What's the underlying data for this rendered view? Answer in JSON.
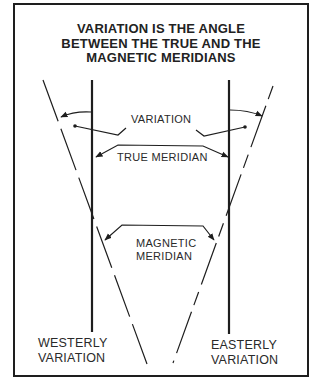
{
  "title": {
    "line1": "VARIATION IS THE ANGLE",
    "line2": "BETWEEN THE TRUE AND THE",
    "line3": "MAGNETIC MERIDIANS"
  },
  "labels": {
    "variation": "VARIATION",
    "true_meridian": "TRUE MERIDIAN",
    "magnetic_meridian_line1": "MAGNETIC",
    "magnetic_meridian_line2": "MERIDIAN",
    "westerly_line1": "WESTERLY",
    "westerly_line2": "VARIATION",
    "easterly_line1": "EASTERLY",
    "easterly_line2": "VARIATION"
  },
  "colors": {
    "ink": "#1e1e1e",
    "background": "#ffffff"
  }
}
